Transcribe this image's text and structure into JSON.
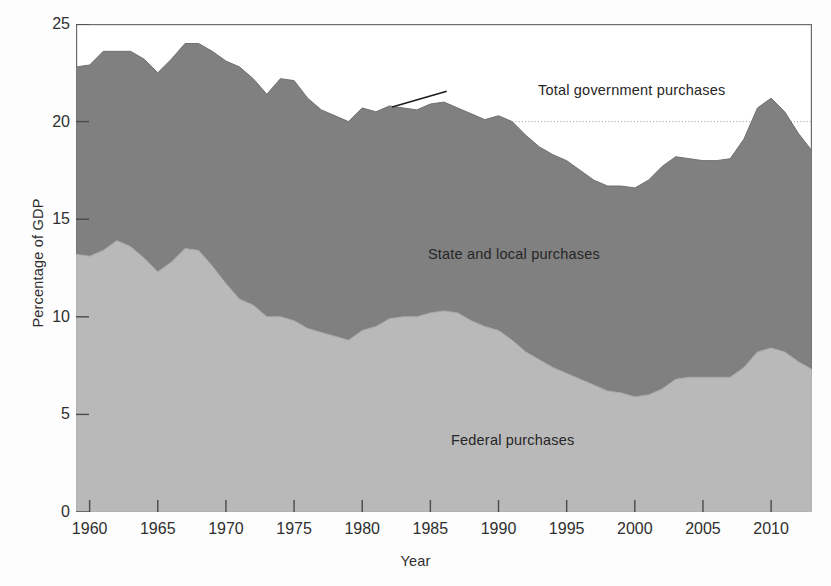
{
  "chart_data": {
    "type": "area",
    "title": "",
    "subtitle": "",
    "xlabel": "Year",
    "ylabel": "Percentage of GDP",
    "xlim": [
      1959,
      2013
    ],
    "ylim": [
      0,
      25
    ],
    "xticks": [
      1960,
      1965,
      1970,
      1975,
      1980,
      1985,
      1990,
      1995,
      2000,
      2005,
      2010
    ],
    "yticks": [
      0,
      5,
      10,
      15,
      20,
      25
    ],
    "grid": "dotted horizontal gridline at y = 20 only",
    "legend_position": "inline annotations on the plot",
    "stacked": true,
    "annotations": [
      {
        "text": "Total government purchases",
        "target": "upper boundary of stacked area near 1982",
        "leader_line": true
      },
      {
        "text": "State and local purchases",
        "target": "upper (dark) band"
      },
      {
        "text": "Federal purchases",
        "target": "lower (light) band"
      }
    ],
    "colors": {
      "state_and_local": "#808080",
      "federal": "#b9b9b9",
      "axis": "#5c5c5c",
      "text": "#2f2f2f",
      "background": "#fdfdfd"
    },
    "x": [
      1959,
      1960,
      1961,
      1962,
      1963,
      1964,
      1965,
      1966,
      1967,
      1968,
      1969,
      1970,
      1971,
      1972,
      1973,
      1974,
      1975,
      1976,
      1977,
      1978,
      1979,
      1980,
      1981,
      1982,
      1983,
      1984,
      1985,
      1986,
      1987,
      1988,
      1989,
      1990,
      1991,
      1992,
      1993,
      1994,
      1995,
      1996,
      1997,
      1998,
      1999,
      2000,
      2001,
      2002,
      2003,
      2004,
      2005,
      2006,
      2007,
      2008,
      2009,
      2010,
      2011,
      2012,
      2013
    ],
    "series": [
      {
        "name": "Federal purchases",
        "values": [
          13.2,
          13.1,
          13.4,
          13.9,
          13.6,
          13.0,
          12.3,
          12.8,
          13.5,
          13.4,
          12.6,
          11.7,
          10.9,
          10.6,
          10.0,
          10.0,
          9.8,
          9.4,
          9.2,
          9.0,
          8.8,
          9.3,
          9.5,
          9.9,
          10.0,
          10.0,
          10.2,
          10.3,
          10.2,
          9.8,
          9.5,
          9.3,
          8.8,
          8.2,
          7.8,
          7.4,
          7.1,
          6.8,
          6.5,
          6.2,
          6.1,
          5.9,
          6.0,
          6.3,
          6.8,
          6.9,
          6.9,
          6.9,
          6.9,
          7.4,
          8.2,
          8.4,
          8.2,
          7.7,
          7.3
        ]
      },
      {
        "name": "State and local purchases",
        "values": [
          9.6,
          9.8,
          10.2,
          9.7,
          10.0,
          10.2,
          10.2,
          10.4,
          10.5,
          10.6,
          11.0,
          11.4,
          11.9,
          11.6,
          11.4,
          12.2,
          12.3,
          11.8,
          11.4,
          11.3,
          11.2,
          11.4,
          11.0,
          10.9,
          10.7,
          10.6,
          10.7,
          10.7,
          10.5,
          10.6,
          10.6,
          11.0,
          11.2,
          11.1,
          10.9,
          10.9,
          10.9,
          10.7,
          10.5,
          10.5,
          10.6,
          10.7,
          11.0,
          11.4,
          11.4,
          11.2,
          11.1,
          11.1,
          11.2,
          11.7,
          12.5,
          12.8,
          12.3,
          11.7,
          11.2
        ]
      }
    ],
    "total": [
      22.8,
      22.9,
      23.6,
      23.6,
      23.6,
      23.2,
      22.5,
      23.2,
      24.0,
      24.0,
      23.6,
      23.1,
      22.8,
      22.2,
      21.4,
      22.2,
      22.1,
      21.2,
      20.6,
      20.3,
      20.0,
      20.7,
      20.5,
      20.8,
      20.7,
      20.6,
      20.9,
      21.0,
      20.7,
      20.4,
      20.1,
      20.3,
      20.0,
      19.3,
      18.7,
      18.3,
      18.0,
      17.5,
      17.0,
      16.7,
      16.7,
      16.6,
      17.0,
      17.7,
      18.2,
      18.1,
      18.0,
      18.0,
      18.1,
      19.1,
      20.7,
      21.2,
      20.5,
      19.4,
      18.5
    ]
  },
  "axes": {
    "ylabel": "Percentage of GDP",
    "xlabel": "Year",
    "yticks": [
      "0",
      "5",
      "10",
      "15",
      "20",
      "25"
    ],
    "xticks": [
      "1960",
      "1965",
      "1970",
      "1975",
      "1980",
      "1985",
      "1990",
      "1995",
      "2000",
      "2005",
      "2010"
    ]
  },
  "labels": {
    "total": "Total government purchases",
    "state_local": "State and local purchases",
    "federal": "Federal purchases"
  }
}
